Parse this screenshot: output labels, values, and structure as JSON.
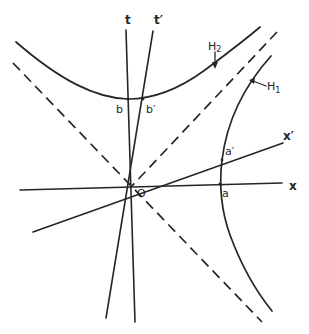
{
  "diagram": {
    "type": "minkowski-spacetime-hyperbolae",
    "labels": {
      "x": "x",
      "x_prime": "x′",
      "t": "t",
      "t_prime": "t′",
      "origin": "O",
      "a": "a",
      "a_prime": "a′",
      "b": "b",
      "b_prime": "b′",
      "H1": "H",
      "H1_sub": "1",
      "H2": "H",
      "H2_sub": "2"
    },
    "elements": [
      {
        "id": "x-axis",
        "kind": "solid-line"
      },
      {
        "id": "x-prime-axis",
        "kind": "solid-line"
      },
      {
        "id": "t-axis",
        "kind": "solid-line"
      },
      {
        "id": "t-prime-axis",
        "kind": "solid-line"
      },
      {
        "id": "light-cone-1",
        "kind": "dashed-line"
      },
      {
        "id": "light-cone-2",
        "kind": "dashed-line"
      },
      {
        "id": "hyperbola-H1",
        "kind": "curve",
        "note": "spacelike hyperbola through a and a′"
      },
      {
        "id": "hyperbola-H2",
        "kind": "curve",
        "note": "timelike hyperbola through b and b′"
      }
    ],
    "colors": {
      "ink": "#262626",
      "background": "#ffffff"
    }
  }
}
